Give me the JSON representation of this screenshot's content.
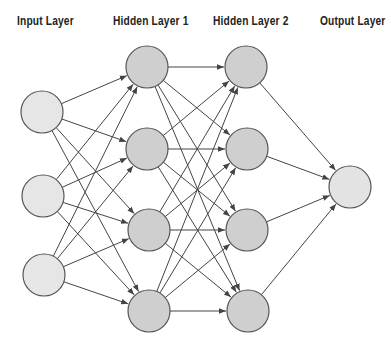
{
  "diagram": {
    "type": "feedforward-neural-network",
    "layers": [
      {
        "id": "input",
        "label": "Input Layer",
        "label_x": 17,
        "nodes": [
          {
            "x": 42,
            "y": 112
          },
          {
            "x": 43,
            "y": 196
          },
          {
            "x": 44,
            "y": 275
          }
        ],
        "fill": "#e6e6e6"
      },
      {
        "id": "hidden1",
        "label": "Hidden Layer 1",
        "label_x": 113,
        "nodes": [
          {
            "x": 147,
            "y": 67
          },
          {
            "x": 147,
            "y": 149
          },
          {
            "x": 149,
            "y": 230
          },
          {
            "x": 149,
            "y": 311
          }
        ],
        "fill": "#cfcfcf"
      },
      {
        "id": "hidden2",
        "label": "Hidden Layer 2",
        "label_x": 213,
        "nodes": [
          {
            "x": 246,
            "y": 67
          },
          {
            "x": 247,
            "y": 149
          },
          {
            "x": 247,
            "y": 230
          },
          {
            "x": 248,
            "y": 311
          }
        ],
        "fill": "#cfcfcf"
      },
      {
        "id": "output",
        "label": "Output Layer",
        "label_x": 320,
        "nodes": [
          {
            "x": 350,
            "y": 187
          }
        ],
        "fill": "#e3e3e3"
      }
    ],
    "node_radius": 21,
    "stroke_color": "#555555",
    "edge_color": "#444444",
    "fully_connected": true
  }
}
